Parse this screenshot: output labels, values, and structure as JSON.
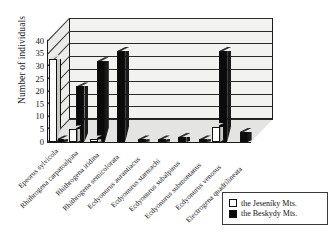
{
  "chart_data": {
    "type": "bar",
    "title": "",
    "subtitle": "",
    "xlabel": "",
    "ylabel": "Number of individuals",
    "ylim": [
      0,
      40
    ],
    "ytick_values": [
      0,
      5,
      10,
      15,
      20,
      25,
      30,
      35,
      40
    ],
    "ytick_labels": [
      "0",
      "5",
      "10",
      "15",
      "20",
      "25",
      "30",
      "35",
      "40"
    ],
    "grid": true,
    "grid_axis": "y",
    "legend_position": "bottom-right",
    "three_d": true,
    "categories": [
      "Epeorus sylvicola",
      "Rhithrogena carpatoalpina",
      "Rhithrogena iridina",
      "Rhithrogena semicolorata",
      "Ecdyonurus aurantiacus",
      "Ecdyonurus starmachi",
      "Ecdyonurus subalpinus",
      "Ecdyonurus submontanus",
      "Ecdyonurus venosus",
      "Electrogena quadrilineata"
    ],
    "series": [
      {
        "name": "the Jeseniky Mts.",
        "color": "#ffffff",
        "values": [
          33,
          5,
          1,
          0,
          0,
          0,
          0,
          0,
          6,
          0
        ]
      },
      {
        "name": "the Beskydy Mts.",
        "color": "#0b0b0b",
        "values": [
          1,
          22,
          32,
          36,
          1,
          1,
          2,
          1,
          36,
          4
        ]
      }
    ]
  },
  "axis": {
    "y_title": "Number of individuals",
    "ticks": [
      "40",
      "35",
      "30",
      "25",
      "20",
      "15",
      "10",
      "5",
      "0"
    ]
  },
  "legend": {
    "entries": [
      {
        "marker": "open-square-icon",
        "label": "the Jeseníky Mts."
      },
      {
        "marker": "filled-square-icon",
        "label": "the Beskydy Mts."
      }
    ]
  },
  "x_axis_labels": [
    "Epeorus sylvicola",
    "Rhithrogena carpatoalpina",
    "Rhithrogena iridina",
    "Rhithrogena semicolorata",
    "Ecdyonurus aurantiacus",
    "Ecdyonurus starmachi",
    "Ecdyonurus subalpinus",
    "Ecdyonurus submontanus",
    "Ecdyonurus venosus",
    "Electrogena quadrilineata"
  ]
}
